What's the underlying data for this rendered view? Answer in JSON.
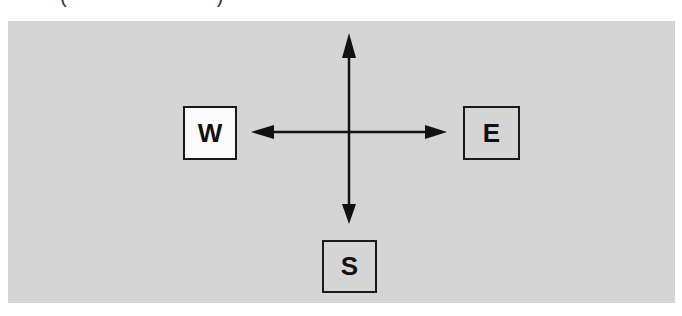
{
  "caption": {
    "open_paren": "(",
    "close_paren": ")",
    "text": ""
  },
  "diagram": {
    "background_color": "#d5d5d5",
    "line_color": "#111111",
    "center": {
      "x": 349,
      "y": 132
    },
    "arrows": [
      {
        "direction": "north",
        "tip": {
          "x": 349,
          "y": 33
        }
      },
      {
        "direction": "south",
        "tip": {
          "x": 349,
          "y": 224
        }
      },
      {
        "direction": "west",
        "tip": {
          "x": 251,
          "y": 132
        }
      },
      {
        "direction": "east",
        "tip": {
          "x": 447,
          "y": 132
        }
      }
    ],
    "boxes": {
      "west": {
        "label": "W",
        "fill": "#fbfbfb"
      },
      "east": {
        "label": "E",
        "fill": "#d5d5d5"
      },
      "south": {
        "label": "S",
        "fill": "#d5d5d5"
      }
    }
  }
}
